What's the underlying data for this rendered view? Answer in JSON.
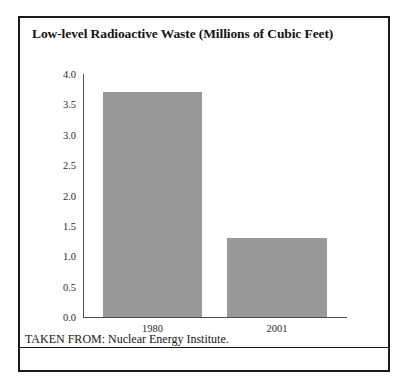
{
  "figure": {
    "title": "Low-level Radioactive Waste (Millions of Cubic Feet)",
    "source_note": "TAKEN FROM: Nuclear Energy Institute.",
    "frame_color": "#1b1b1b",
    "background_color": "#ffffff"
  },
  "chart_data": {
    "type": "bar",
    "title": "Low-level Radioactive Waste (Millions of Cubic Feet)",
    "xlabel": "",
    "ylabel": "",
    "categories": [
      "1980",
      "2001"
    ],
    "values": [
      3.7,
      1.3
    ],
    "ylim": [
      0.0,
      4.0
    ],
    "ytick_labels": [
      "4.0",
      "3.5",
      "3.0",
      "2.5",
      "2.0",
      "1.5",
      "1.0",
      "0.5",
      "0.0"
    ],
    "ytick_values": [
      4.0,
      3.5,
      3.0,
      2.5,
      2.0,
      1.5,
      1.0,
      0.5,
      0.0
    ],
    "grid": false,
    "legend": null,
    "bar_color": "#999999",
    "axis_color": "#4d4d4d",
    "annotations": []
  }
}
